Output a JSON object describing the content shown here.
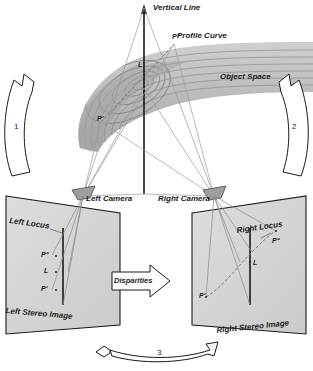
{
  "diagram": {
    "title_region": "stereo photogrammetry object space and stereo image pair",
    "object_space": {
      "vertical_line_label": "Vertical Line",
      "profile_curve_label": "Profile Curve",
      "space_label": "Object Space",
      "point_top_label": "Pʺ",
      "point_mid_label": "L",
      "point_left_label": "Pʹ"
    },
    "cameras": {
      "left_label": "Left Camera",
      "right_label": "Right Camera"
    },
    "left_image": {
      "locus_label": "Left Locus",
      "caption": "Left Stereo Image",
      "points": [
        "Pʺ",
        "L",
        "Pʹ"
      ]
    },
    "right_image": {
      "locus_label": "Right Locus",
      "caption": "Right Stereo Image",
      "points": [
        "Pʺ",
        "L",
        "Pʹ"
      ]
    },
    "disparities": {
      "label": "Disparities"
    },
    "flow_arrows": [
      {
        "number": "1",
        "position": "left"
      },
      {
        "number": "2",
        "position": "right"
      },
      {
        "number": "3",
        "position": "bottom"
      }
    ],
    "colors": {
      "ink": "#1a1a1a",
      "ray": "#8a8a8a",
      "plane_fill": "#d9d9d9",
      "surface_dark": "#9a9a9a",
      "surface_light": "#e2e2e2",
      "camera_fill": "#9e9e9e"
    }
  }
}
